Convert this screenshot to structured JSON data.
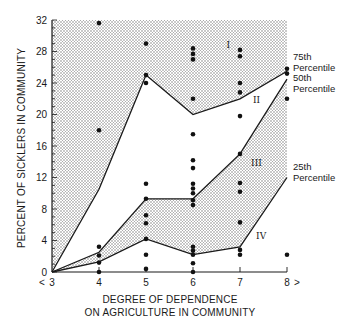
{
  "chart_data": {
    "type": "scatter",
    "title": "",
    "xlabel": "DEGREE OF DEPENDENCE ON AGRICULTURE IN COMMUNITY",
    "xlabel_lines": [
      "DEGREE OF DEPENDENCE",
      "ON AGRICULTURE IN COMMUNITY"
    ],
    "ylabel": "PERCENT OF SICKLERS IN COMMUNITY",
    "xlim": [
      3,
      8
    ],
    "ylim": [
      0,
      32
    ],
    "xticks": [
      3,
      4,
      5,
      6,
      7,
      8
    ],
    "yticks": [
      0,
      4,
      8,
      12,
      16,
      20,
      24,
      28,
      32
    ],
    "grid": false,
    "x_arrow_left": "<",
    "x_arrow_right": ">",
    "series": [
      {
        "name": "75th Percentile",
        "type": "line",
        "x": [
          3,
          4,
          5,
          6,
          7,
          8
        ],
        "values": [
          0,
          10.5,
          25,
          20,
          22,
          25.5
        ]
      },
      {
        "name": "50th Percentile",
        "type": "line",
        "x": [
          3,
          4,
          5,
          6,
          7,
          8
        ],
        "values": [
          0,
          2.5,
          9.3,
          9.3,
          15,
          24.5
        ]
      },
      {
        "name": "25th Percentile",
        "type": "line",
        "x": [
          3,
          4,
          5,
          6,
          7,
          8
        ],
        "values": [
          0,
          1.3,
          4.2,
          2.2,
          3.2,
          12
        ]
      },
      {
        "name": "Communities",
        "type": "scatter",
        "points": [
          [
            4,
            31.6
          ],
          [
            4,
            18
          ],
          [
            4,
            3.2
          ],
          [
            4,
            2.1
          ],
          [
            4,
            1.2
          ],
          [
            4,
            0
          ],
          [
            5,
            29
          ],
          [
            5,
            25
          ],
          [
            5,
            24
          ],
          [
            5,
            11.2
          ],
          [
            5,
            9.3
          ],
          [
            5,
            7.2
          ],
          [
            5,
            6.2
          ],
          [
            5,
            4.2
          ],
          [
            5,
            2.2
          ],
          [
            5,
            0.4
          ],
          [
            6,
            28.4
          ],
          [
            6,
            27.7
          ],
          [
            6,
            27
          ],
          [
            6,
            22
          ],
          [
            6,
            17.5
          ],
          [
            6,
            14.2
          ],
          [
            6,
            13.2
          ],
          [
            6,
            11.2
          ],
          [
            6,
            10.6
          ],
          [
            6,
            10
          ],
          [
            6,
            9.1
          ],
          [
            6,
            8.5
          ],
          [
            6,
            3.2
          ],
          [
            6,
            2.7
          ],
          [
            6,
            2.2
          ],
          [
            6,
            1.1
          ],
          [
            6,
            0
          ],
          [
            7,
            28.2
          ],
          [
            7,
            27.4
          ],
          [
            7,
            24
          ],
          [
            7,
            22.8
          ],
          [
            7,
            19.8
          ],
          [
            7,
            15
          ],
          [
            7,
            11.3
          ],
          [
            7,
            10.2
          ],
          [
            7,
            6.3
          ],
          [
            7,
            2.8
          ],
          [
            7,
            2.2
          ],
          [
            8,
            25.8
          ],
          [
            8,
            25.2
          ],
          [
            8,
            22
          ],
          [
            8,
            2.2
          ]
        ]
      }
    ],
    "regions": [
      {
        "label": "I",
        "shaded": true,
        "between": [
          "top",
          "75th Percentile"
        ],
        "label_at": [
          6.75,
          28.5
        ]
      },
      {
        "label": "II",
        "shaded": false,
        "between": [
          "75th Percentile",
          "50th Percentile"
        ],
        "label_at": [
          7.35,
          21.5
        ]
      },
      {
        "label": "III",
        "shaded": true,
        "between": [
          "50th Percentile",
          "25th Percentile"
        ],
        "label_at": [
          7.35,
          13.5
        ]
      },
      {
        "label": "IV",
        "shaded": false,
        "between": [
          "25th Percentile",
          "bottom"
        ],
        "label_at": [
          7.45,
          4.2
        ]
      }
    ],
    "annotations": [
      {
        "text": [
          "75th",
          "Percentile"
        ],
        "x": 8,
        "y": 25.5
      },
      {
        "text": [
          "50th",
          "Percentile"
        ],
        "x": 8,
        "y": 24.5
      },
      {
        "text": [
          "25th",
          "Percentile"
        ],
        "x": 8,
        "y": 12
      }
    ]
  },
  "colors": {
    "ink": "#1a1a1a",
    "shade_dot": "#8a8a8a",
    "paper": "#ffffff"
  }
}
